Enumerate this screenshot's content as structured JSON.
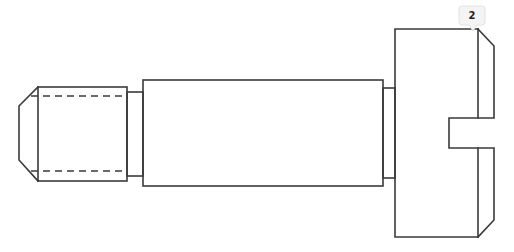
{
  "drawing": {
    "subject": "shoulder-screw-side-view",
    "line_color": "#3a3a3a",
    "background": "#ffffff"
  },
  "balloon": {
    "label": "2",
    "color": "#f4f4f4"
  }
}
